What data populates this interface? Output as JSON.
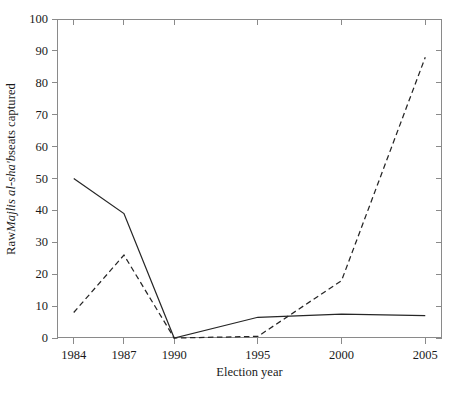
{
  "chart_data": {
    "type": "line",
    "title": "",
    "xlabel": "Election year",
    "ylabel_plain": "Raw Majlis al-sha'b seats captured",
    "ylabel_prefix": "Raw ",
    "ylabel_italic": "Majlis al-sha'b",
    "ylabel_suffix": " seats captured",
    "x": [
      1984,
      1987,
      1990,
      1995,
      2000,
      2005
    ],
    "xtick_labels": [
      "1984",
      "1987",
      "1990",
      "1995",
      "2000",
      "2005"
    ],
    "ytick_labels": [
      "0",
      "10",
      "20",
      "30",
      "40",
      "50",
      "60",
      "70",
      "80",
      "90",
      "100"
    ],
    "yticks": [
      0,
      10,
      20,
      30,
      40,
      50,
      60,
      70,
      80,
      90,
      100
    ],
    "xlim": [
      1983,
      2006
    ],
    "ylim": [
      0,
      100
    ],
    "grid": false,
    "legend": "none",
    "series": [
      {
        "name": "solid-series",
        "style": "solid",
        "color": "#262626",
        "values": [
          50,
          39,
          0,
          6.5,
          7.5,
          7
        ]
      },
      {
        "name": "dashed-series",
        "style": "dashed",
        "color": "#262626",
        "values": [
          8,
          26,
          0,
          0.5,
          18,
          88
        ]
      }
    ]
  },
  "axes": {
    "frame_color": "#8a8a8a",
    "background": "#ffffff"
  }
}
